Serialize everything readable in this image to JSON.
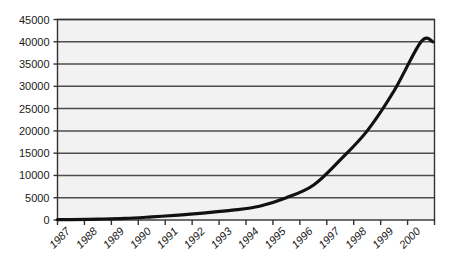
{
  "chart_data": {
    "type": "line",
    "title": "",
    "subtitle": "",
    "xlabel": "",
    "ylabel": "",
    "categories": [
      "1987",
      "1988",
      "1989",
      "1990",
      "1991",
      "1992",
      "1993",
      "1994",
      "1995",
      "1996",
      "1997",
      "1998",
      "1999",
      "2000"
    ],
    "values": [
      100,
      200,
      350,
      700,
      1100,
      1600,
      2200,
      3100,
      5000,
      7800,
      13500,
      20000,
      29000,
      40000
    ],
    "series": [
      {
        "name": "growth",
        "values": [
          100,
          200,
          350,
          700,
          1100,
          1600,
          2200,
          3100,
          5000,
          7800,
          13500,
          20000,
          29000,
          40000
        ],
        "color": "#111111"
      }
    ],
    "ylim": [
      0,
      45000
    ],
    "ytick_labels": [
      "0",
      "5000",
      "10000",
      "15000",
      "20000",
      "25000",
      "30000",
      "35000",
      "40000",
      "45000"
    ],
    "ytick_values": [
      0,
      5000,
      10000,
      15000,
      20000,
      25000,
      30000,
      35000,
      40000,
      45000
    ],
    "xtick_labels": [
      "1987",
      "1988",
      "1989",
      "1990",
      "1991",
      "1992",
      "1993",
      "1994",
      "1995",
      "1996",
      "1997",
      "1998",
      "1999",
      "2000"
    ],
    "grid": true,
    "grid_axis": "y",
    "legend": false,
    "legend_position": "none",
    "xtick_label_rotation": 45,
    "colors": {
      "line": "#111111",
      "grid": "#4d4d4d",
      "axis": "#333333",
      "plot_background": "#f2f2f2",
      "page_background": "#ffffff",
      "tick_text": "#1a1a1a"
    }
  }
}
